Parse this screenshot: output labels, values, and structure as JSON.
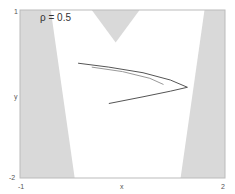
{
  "chart_data": {
    "type": "line",
    "title": "ρ = 0.5",
    "xlabel": "x",
    "ylabel": "y",
    "xlim": [
      -1,
      2
    ],
    "ylim": [
      -2,
      1
    ],
    "x_ticks": [
      "-1",
      "2"
    ],
    "y_ticks": [
      "1",
      "-2"
    ],
    "grid": false,
    "legend": null,
    "shaded_regions": [
      {
        "name": "left-wedge",
        "color": "#d9d9d9",
        "polygon": [
          [
            -1,
            1
          ],
          [
            -0.55,
            1
          ],
          [
            -0.2,
            -2
          ],
          [
            -1,
            -2
          ]
        ]
      },
      {
        "name": "top-v",
        "color": "#d9d9d9",
        "polygon": [
          [
            0.05,
            1
          ],
          [
            0.75,
            1
          ],
          [
            0.4,
            0.42
          ]
        ]
      },
      {
        "name": "right-wedge",
        "color": "#d9d9d9",
        "polygon": [
          [
            1.7,
            1
          ],
          [
            2,
            1
          ],
          [
            2,
            -2
          ],
          [
            1.35,
            -2
          ]
        ]
      }
    ],
    "series": [
      {
        "name": "outer-curve",
        "color": "#555555",
        "x": [
          -0.15,
          0.3,
          0.8,
          1.2,
          1.45,
          1.2,
          0.8,
          0.3
        ],
        "y": [
          0.05,
          -0.02,
          -0.12,
          -0.25,
          -0.38,
          -0.45,
          -0.55,
          -0.67
        ]
      },
      {
        "name": "inner-curve",
        "color": "#999999",
        "x": [
          0.05,
          0.5,
          0.9,
          1.1
        ],
        "y": [
          -0.02,
          -0.1,
          -0.22,
          -0.33
        ]
      }
    ]
  },
  "labels": {
    "title": "ρ = 0.5",
    "xlabel": "x",
    "ylabel": "y",
    "ytick_top": "1",
    "ytick_bottom": "-2",
    "xtick_left": "-1",
    "xtick_right": "2"
  },
  "colors": {
    "shade": "#d9d9d9",
    "axis": "#bbbbbb",
    "curve": "#555555",
    "curve_light": "#999999"
  }
}
